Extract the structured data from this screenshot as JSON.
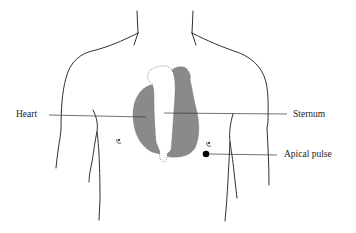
{
  "diagram": {
    "labels": {
      "heart": "Heart",
      "sternum": "Sternum",
      "apical_pulse": "Apical pulse"
    },
    "colors": {
      "outline": "#1a1a1a",
      "heart_fill": "#8a8a8a",
      "sternum_fill": "#ffffff",
      "apical_dot": "#000000",
      "leader_line": "#333333"
    }
  }
}
